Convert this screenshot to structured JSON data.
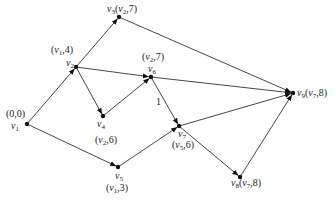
{
  "diagram": {
    "type": "directed-graph",
    "nodes": [
      {
        "id": "v1",
        "name": "v",
        "sub": "1",
        "x": 27,
        "y": 124,
        "label": "(0,0)",
        "label_pre": "(0,0)",
        "label_pos": "above"
      },
      {
        "id": "v2",
        "name": "v",
        "sub": "2",
        "x": 76,
        "y": 67,
        "label_parts": [
          "(v",
          "1",
          ",4)"
        ],
        "label_pos": "above"
      },
      {
        "id": "v3",
        "name": "v",
        "sub": "3",
        "x": 119,
        "y": 17,
        "label_parts": [
          "(v",
          "2",
          ",7)"
        ],
        "label_pos": "right"
      },
      {
        "id": "v4",
        "name": "v",
        "sub": "4",
        "x": 103,
        "y": 116,
        "label_parts": [
          "(v",
          "2",
          ",6)"
        ],
        "label_pos": "below"
      },
      {
        "id": "v5",
        "name": "v",
        "sub": "5",
        "x": 118,
        "y": 167,
        "label_parts": [
          "(v",
          "1",
          ",3)"
        ],
        "label_pos": "below"
      },
      {
        "id": "v6",
        "name": "v",
        "sub": "6",
        "x": 151,
        "y": 77,
        "label_parts": [
          "(v",
          "2",
          ",7)"
        ],
        "label_pos": "above"
      },
      {
        "id": "v7",
        "name": "v",
        "sub": "7",
        "x": 179,
        "y": 126,
        "label_parts": [
          "(v",
          "5",
          ",6)"
        ],
        "label_pos": "below"
      },
      {
        "id": "v8",
        "name": "v",
        "sub": "8",
        "x": 240,
        "y": 177,
        "label_parts": [
          "(v",
          "7",
          ",8)"
        ],
        "label_pos": "right"
      },
      {
        "id": "v9",
        "name": "v",
        "sub": "9",
        "x": 293,
        "y": 93,
        "label_parts": [
          "(v",
          "7",
          ",8)"
        ],
        "label_pos": "right"
      }
    ],
    "edges": [
      {
        "from": "v1",
        "to": "v2"
      },
      {
        "from": "v1",
        "to": "v5"
      },
      {
        "from": "v2",
        "to": "v3"
      },
      {
        "from": "v2",
        "to": "v4"
      },
      {
        "from": "v2",
        "to": "v6"
      },
      {
        "from": "v3",
        "to": "v9"
      },
      {
        "from": "v4",
        "to": "v6"
      },
      {
        "from": "v5",
        "to": "v7"
      },
      {
        "from": "v6",
        "to": "v9"
      },
      {
        "from": "v6",
        "to": "v7",
        "weight": "1"
      },
      {
        "from": "v7",
        "to": "v8"
      },
      {
        "from": "v7",
        "to": "v9"
      },
      {
        "from": "v8",
        "to": "v9"
      }
    ],
    "labels": {
      "v1_label": "(0,0)",
      "edge_weight_v6_v7": "1"
    }
  }
}
